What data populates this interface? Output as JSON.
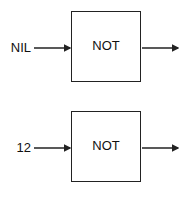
{
  "diagrams": [
    {
      "input": "NIL",
      "gate": "NOT"
    },
    {
      "input": "12",
      "gate": "NOT"
    }
  ],
  "colors": {
    "stroke": "#222222",
    "background": "#ffffff"
  }
}
